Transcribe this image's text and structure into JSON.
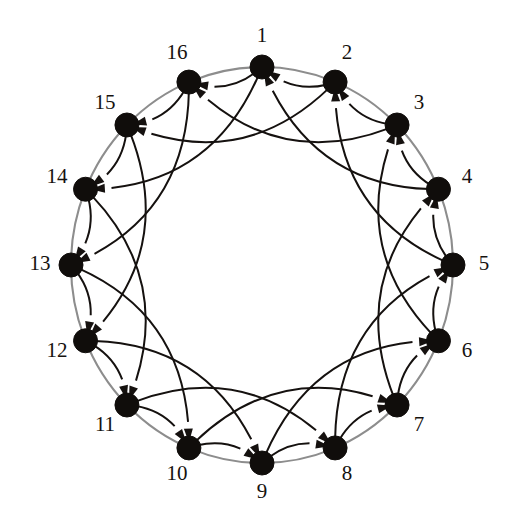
{
  "figure": {
    "kind": "directed-graph-diagram",
    "background_color": "#ffffff",
    "node_color": "#100d0b",
    "edge_color": "#15110f",
    "ring_color": "#8d8d8d",
    "label_color": "#16120f"
  },
  "canvas": {
    "width": 515,
    "height": 520,
    "center_x": 262,
    "center_y": 265,
    "ring_radius_x": 191,
    "ring_radius_y": 198,
    "node_radius": 12,
    "label_radius_x": 222,
    "label_radius_y": 228
  },
  "graph": {
    "node_count": 16,
    "node_labels": [
      "1",
      "2",
      "3",
      "4",
      "5",
      "6",
      "7",
      "8",
      "9",
      "10",
      "11",
      "12",
      "13",
      "14",
      "15",
      "16"
    ],
    "first_node_angle_deg": -90,
    "direction": "clockwise",
    "edge_steps": [
      1,
      3
    ],
    "edge_orientation": "from node i to node i minus step (counterclockwise)",
    "in_degree_per_node": 2,
    "out_degree_per_node": 2,
    "short_edge_bow": 0.3,
    "long_edge_bow": 0.34,
    "arrow_length": 14,
    "arrow_width": 9,
    "edges": [
      {
        "from": 2,
        "to": 1,
        "step": 1
      },
      {
        "from": 3,
        "to": 2,
        "step": 1
      },
      {
        "from": 4,
        "to": 3,
        "step": 1
      },
      {
        "from": 5,
        "to": 4,
        "step": 1
      },
      {
        "from": 6,
        "to": 5,
        "step": 1
      },
      {
        "from": 7,
        "to": 6,
        "step": 1
      },
      {
        "from": 8,
        "to": 7,
        "step": 1
      },
      {
        "from": 9,
        "to": 8,
        "step": 1
      },
      {
        "from": 10,
        "to": 9,
        "step": 1
      },
      {
        "from": 11,
        "to": 10,
        "step": 1
      },
      {
        "from": 12,
        "to": 11,
        "step": 1
      },
      {
        "from": 13,
        "to": 12,
        "step": 1
      },
      {
        "from": 14,
        "to": 13,
        "step": 1
      },
      {
        "from": 15,
        "to": 14,
        "step": 1
      },
      {
        "from": 16,
        "to": 15,
        "step": 1
      },
      {
        "from": 1,
        "to": 16,
        "step": 1
      },
      {
        "from": 4,
        "to": 1,
        "step": 3
      },
      {
        "from": 5,
        "to": 2,
        "step": 3
      },
      {
        "from": 6,
        "to": 3,
        "step": 3
      },
      {
        "from": 7,
        "to": 4,
        "step": 3
      },
      {
        "from": 8,
        "to": 5,
        "step": 3
      },
      {
        "from": 9,
        "to": 6,
        "step": 3
      },
      {
        "from": 10,
        "to": 7,
        "step": 3
      },
      {
        "from": 11,
        "to": 8,
        "step": 3
      },
      {
        "from": 12,
        "to": 9,
        "step": 3
      },
      {
        "from": 13,
        "to": 10,
        "step": 3
      },
      {
        "from": 14,
        "to": 11,
        "step": 3
      },
      {
        "from": 15,
        "to": 12,
        "step": 3
      },
      {
        "from": 16,
        "to": 13,
        "step": 3
      },
      {
        "from": 1,
        "to": 14,
        "step": 3
      },
      {
        "from": 2,
        "to": 15,
        "step": 3
      },
      {
        "from": 3,
        "to": 16,
        "step": 3
      }
    ]
  }
}
